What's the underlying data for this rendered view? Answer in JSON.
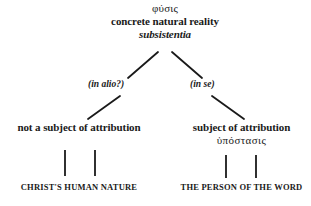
{
  "diagram": {
    "type": "tree",
    "line_color": "#1a1a1a",
    "background": "#ffffff",
    "root": {
      "greek": "φύσις",
      "gloss": "concrete natural reality",
      "latin": "subsistentia"
    },
    "edges": [
      {
        "label": "(in alio?)",
        "side": "left"
      },
      {
        "label": "(in se)",
        "side": "right"
      }
    ],
    "branches": [
      {
        "side": "left",
        "mid_label": "not a subject of attribution",
        "mid_greek": "",
        "leaf_label": "CHRIST'S HUMAN NATURE"
      },
      {
        "side": "right",
        "mid_label": "subject of attribution",
        "mid_greek": "ὑπόστασις",
        "leaf_label": "THE PERSON OF THE WORD"
      }
    ]
  }
}
